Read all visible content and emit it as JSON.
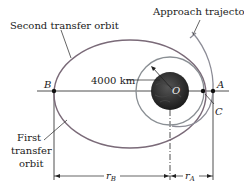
{
  "labels": {
    "second_orbit": "Second transfer orbit",
    "approach": "Approach trajectory",
    "first_orbit_line1": "First",
    "first_orbit_line2": "transfer",
    "first_orbit_line3": "orbit",
    "radius": "4000 km",
    "point_b": "B",
    "point_a": "A",
    "point_c": "C",
    "center_o": "O",
    "r_b": "r",
    "r_b_sub": "B",
    "r_a": "r",
    "r_a_sub": "A"
  },
  "colors": {
    "orbit": "#7a6a78",
    "circle": "#8a8f94",
    "approach": "#8c8c96",
    "line": "#222222",
    "planet": "#2b2b2b"
  }
}
